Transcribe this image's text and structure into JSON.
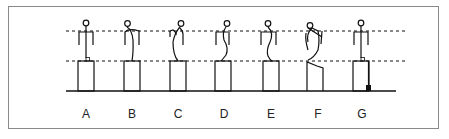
{
  "figure": {
    "colors": {
      "line": "#111111",
      "frame": "#8a8a8a",
      "background": "#ffffff"
    },
    "reference_lines": [
      "upper-dotted-line",
      "lower-dotted-line"
    ],
    "panels": [
      {
        "label": "A",
        "pose": "upright",
        "marker": "small-square-at-hip"
      },
      {
        "label": "B",
        "pose": "slight-backward-curve",
        "marker": ""
      },
      {
        "label": "C",
        "pose": "backward-curve",
        "marker": ""
      },
      {
        "label": "D",
        "pose": "s-curve",
        "marker": ""
      },
      {
        "label": "E",
        "pose": "s-curve-pronounced",
        "marker": ""
      },
      {
        "label": "F",
        "pose": "arched-with-crossed-arm",
        "marker": ""
      },
      {
        "label": "G",
        "pose": "upright",
        "marker": "small-square-at-hip-and-filled-weight-at-base"
      }
    ]
  }
}
